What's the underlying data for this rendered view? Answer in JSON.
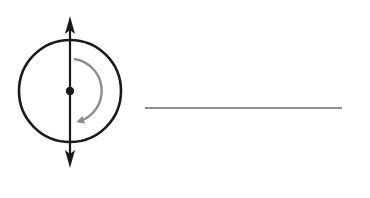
{
  "diagram": {
    "colors": {
      "stroke": "#1a1a1a",
      "rotation_arrow": "#8c8c8c",
      "answer_line": "#8f8f8f",
      "background": "#ffffff"
    },
    "circle": {
      "cx": 70,
      "cy": 91,
      "r": 51
    },
    "axis": {
      "x": 70,
      "y_top": 17,
      "y_bottom": 167
    },
    "center_dot": {
      "cx": 70,
      "cy": 91,
      "r": 4
    },
    "rotation_arrow": {
      "direction": "clockwise"
    },
    "answer_line": {
      "x1": 145,
      "x2": 342,
      "y": 108
    }
  }
}
